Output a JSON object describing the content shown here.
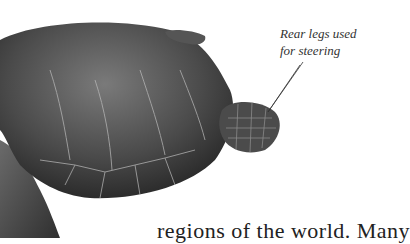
{
  "figure": {
    "caption": {
      "line1": "Rear legs used",
      "line2": "for steering"
    }
  },
  "body_text": "regions of the world. Many"
}
